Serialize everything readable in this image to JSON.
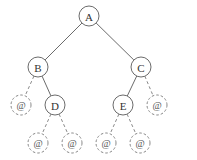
{
  "diagram": {
    "type": "binary-tree",
    "null_symbol": "@",
    "nodes": [
      {
        "id": "A",
        "label": "A",
        "kind": "real",
        "x": 89,
        "y": 16
      },
      {
        "id": "B",
        "label": "B",
        "kind": "real",
        "x": 38,
        "y": 67
      },
      {
        "id": "C",
        "label": "C",
        "kind": "real",
        "x": 141,
        "y": 67
      },
      {
        "id": "nB",
        "label": "@",
        "kind": "null",
        "x": 21,
        "y": 105
      },
      {
        "id": "D",
        "label": "D",
        "kind": "real",
        "x": 55,
        "y": 105
      },
      {
        "id": "E",
        "label": "E",
        "kind": "real",
        "x": 123,
        "y": 105
      },
      {
        "id": "nC",
        "label": "@",
        "kind": "null",
        "x": 157,
        "y": 105
      },
      {
        "id": "nD1",
        "label": "@",
        "kind": "null",
        "x": 38,
        "y": 143
      },
      {
        "id": "nD2",
        "label": "@",
        "kind": "null",
        "x": 72,
        "y": 143
      },
      {
        "id": "nE1",
        "label": "@",
        "kind": "null",
        "x": 106,
        "y": 143
      },
      {
        "id": "nE2",
        "label": "@",
        "kind": "null",
        "x": 140,
        "y": 143
      }
    ],
    "edges": [
      {
        "from": "A",
        "to": "B",
        "style": "solid"
      },
      {
        "from": "A",
        "to": "C",
        "style": "solid"
      },
      {
        "from": "B",
        "to": "nB",
        "style": "dashed"
      },
      {
        "from": "B",
        "to": "D",
        "style": "solid"
      },
      {
        "from": "C",
        "to": "E",
        "style": "solid"
      },
      {
        "from": "C",
        "to": "nC",
        "style": "dashed"
      },
      {
        "from": "D",
        "to": "nD1",
        "style": "dashed"
      },
      {
        "from": "D",
        "to": "nD2",
        "style": "dashed"
      },
      {
        "from": "E",
        "to": "nE1",
        "style": "dashed"
      },
      {
        "from": "E",
        "to": "nE2",
        "style": "dashed"
      }
    ],
    "node_radius": 10
  }
}
